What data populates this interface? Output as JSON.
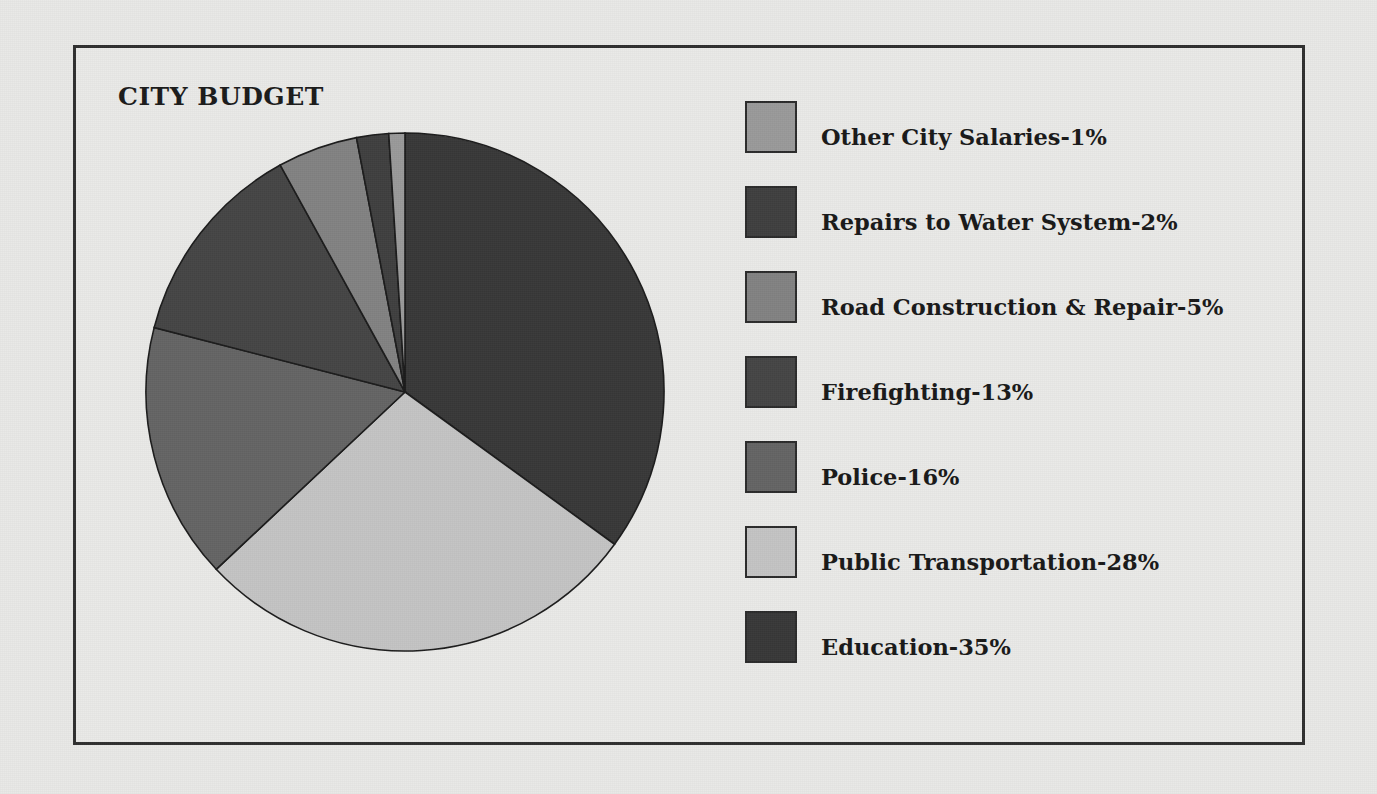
{
  "figure": {
    "title": "CITY BUDGET",
    "background_color": "#e8e8e6",
    "frame_color": "#2f2f2f"
  },
  "chart_data": {
    "type": "pie",
    "title": "CITY BUDGET",
    "xlabel": "",
    "ylabel": "",
    "legend_position": "right",
    "grid": false,
    "start_angle_deg": 90,
    "direction": "clockwise",
    "units": "percent",
    "categories": [
      "Other City Salaries",
      "Repairs to Water System",
      "Road Construction & Repair",
      "Firefighting",
      "Police",
      "Public Transportation",
      "Education"
    ],
    "values": [
      1,
      2,
      5,
      13,
      16,
      28,
      35
    ],
    "labels": [
      "Other City Salaries-1%",
      "Repairs to Water System-2%",
      "Road Construction & Repair-5%",
      "Firefighting-13%",
      "Police-16%",
      "Public Transportation-28%",
      "Education-35%"
    ],
    "colors": [
      "#9a9a9a",
      "#3f3f3f",
      "#828282",
      "#454545",
      "#646464",
      "#c4c4c4",
      "#383838"
    ],
    "slices": [
      {
        "name": "Education",
        "value": 35,
        "color": "#383838",
        "label": "Education-35%"
      },
      {
        "name": "Public Transportation",
        "value": 28,
        "color": "#c4c4c4",
        "label": "Public Transportation-28%"
      },
      {
        "name": "Police",
        "value": 16,
        "color": "#646464",
        "label": "Police-16%"
      },
      {
        "name": "Firefighting",
        "value": 13,
        "color": "#454545",
        "label": "Firefighting-13%"
      },
      {
        "name": "Road Construction & Repair",
        "value": 5,
        "color": "#828282",
        "label": "Road Construction & Repair-5%"
      },
      {
        "name": "Repairs to Water System",
        "value": 2,
        "color": "#3f3f3f",
        "label": "Repairs to Water System-2%"
      },
      {
        "name": "Other City Salaries",
        "value": 1,
        "color": "#9a9a9a",
        "label": "Other City Salaries-1%"
      }
    ]
  },
  "legend": {
    "items": [
      {
        "label": "Other City Salaries-1%",
        "color": "#9a9a9a"
      },
      {
        "label": "Repairs to Water System-2%",
        "color": "#3f3f3f"
      },
      {
        "label": "Road Construction & Repair-5%",
        "color": "#828282"
      },
      {
        "label": "Firefighting-13%",
        "color": "#454545"
      },
      {
        "label": "Police-16%",
        "color": "#646464"
      },
      {
        "label": "Public Transportation-28%",
        "color": "#c4c4c4"
      },
      {
        "label": "Education-35%",
        "color": "#383838"
      }
    ]
  }
}
